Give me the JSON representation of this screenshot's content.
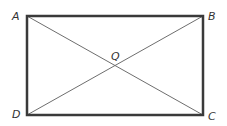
{
  "diagram": {
    "type": "rectangle-with-diagonals",
    "vertices": {
      "A": {
        "label": "A",
        "x": 27,
        "y": 16
      },
      "B": {
        "label": "B",
        "x": 203,
        "y": 16
      },
      "C": {
        "label": "C",
        "x": 203,
        "y": 115
      },
      "D": {
        "label": "D",
        "x": 27,
        "y": 115
      }
    },
    "intersection": {
      "label": "Q",
      "x": 115,
      "y": 65.5
    },
    "diagonals": [
      "AC",
      "BD"
    ],
    "colors": {
      "rectangle_stroke": "#3a3a3a",
      "diagonal_stroke": "#6e6e6e",
      "label": "#333333"
    }
  }
}
